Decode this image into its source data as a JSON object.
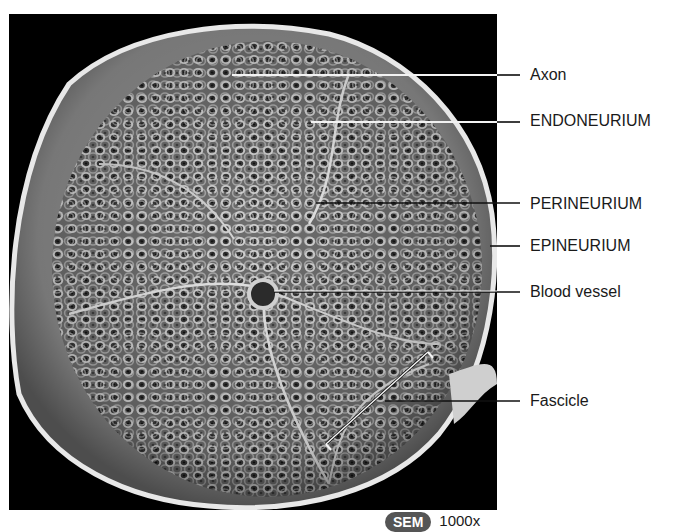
{
  "figure": {
    "labels": [
      {
        "text": "Axon",
        "y": 66,
        "line_y": 75,
        "line_x1": 232
      },
      {
        "text": "ENDONEURIUM",
        "y": 112,
        "line_y": 122,
        "line_x1": 311
      },
      {
        "text": "PERINEURIUM",
        "y": 195,
        "line_y": 203,
        "line_x1": 316
      },
      {
        "text": "EPINEURIUM",
        "y": 237,
        "line_y": 246,
        "line_x1": 490
      },
      {
        "text": "Blood vessel",
        "y": 283,
        "line_y": 292,
        "line_x1": 274
      },
      {
        "text": "Fascicle",
        "y": 392,
        "line_y": 401,
        "line_x1": 385
      }
    ],
    "fascicle_bracket": {
      "x1": 326,
      "y1": 444,
      "x2": 428,
      "y2": 352
    },
    "badge": {
      "text": "SEM",
      "color": "#555555"
    },
    "magnification": "1000x"
  }
}
